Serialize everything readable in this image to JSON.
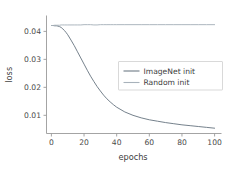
{
  "chart_data": {
    "type": "line",
    "title": "",
    "xlabel": "epochs",
    "ylabel": "loss",
    "xlim": [
      -3,
      103
    ],
    "ylim": [
      0.0035,
      0.0455
    ],
    "grid": false,
    "legend_position": "center-right",
    "xticks": [
      0,
      20,
      40,
      60,
      80,
      100
    ],
    "xtick_labels": [
      "0",
      "20",
      "40",
      "60",
      "80",
      "100"
    ],
    "yticks": [
      0.01,
      0.02,
      0.03,
      0.04
    ],
    "ytick_labels": [
      "0.01",
      "0.02",
      "0.03",
      "0.04"
    ],
    "x": [
      0,
      1,
      2,
      3,
      4,
      5,
      6,
      7,
      8,
      9,
      10,
      12,
      14,
      16,
      18,
      20,
      22,
      24,
      26,
      28,
      30,
      32,
      34,
      36,
      38,
      40,
      45,
      50,
      55,
      60,
      65,
      70,
      75,
      80,
      85,
      90,
      95,
      100
    ],
    "series": [
      {
        "name": "ImageNet init",
        "color": "#6e7a86",
        "values": [
          0.0421,
          0.0421,
          0.042,
          0.042,
          0.0419,
          0.0417,
          0.0414,
          0.0409,
          0.0403,
          0.0396,
          0.0388,
          0.0369,
          0.0349,
          0.0327,
          0.0305,
          0.0283,
          0.0261,
          0.024,
          0.0221,
          0.0203,
          0.0187,
          0.0172,
          0.0159,
          0.0148,
          0.0138,
          0.0129,
          0.0112,
          0.01,
          0.0091,
          0.0084,
          0.0079,
          0.0074,
          0.007,
          0.0066,
          0.0063,
          0.006,
          0.0057,
          0.0054
        ]
      },
      {
        "name": "Random init",
        "color": "#a8b2bb",
        "values": [
          0.0421,
          0.0421,
          0.0422,
          0.0422,
          0.0422,
          0.0422,
          0.0423,
          0.0423,
          0.0423,
          0.0423,
          0.0423,
          0.0423,
          0.0423,
          0.0423,
          0.0423,
          0.0424,
          0.0424,
          0.0424,
          0.0423,
          0.0423,
          0.0424,
          0.0424,
          0.0424,
          0.0424,
          0.0424,
          0.0424,
          0.0424,
          0.0424,
          0.0424,
          0.0424,
          0.0424,
          0.0424,
          0.0424,
          0.0424,
          0.0424,
          0.0424,
          0.0424,
          0.0424
        ]
      }
    ]
  },
  "legend": {
    "entries": [
      {
        "label": "ImageNet init"
      },
      {
        "label": "Random init"
      }
    ]
  },
  "axes": {
    "x_title": "epochs",
    "y_title": "loss"
  },
  "colors": {
    "imagenet_line": "#6e7a86",
    "random_line": "#a8b2bb",
    "spine": "#9a9a9a",
    "text": "#3d3d3d",
    "background": "#ffffff"
  }
}
